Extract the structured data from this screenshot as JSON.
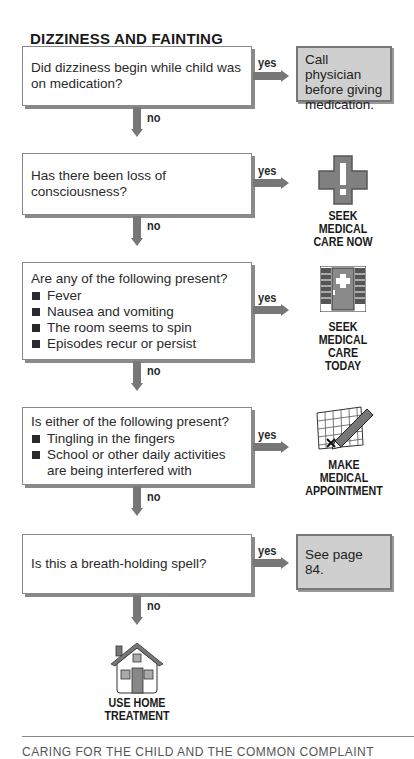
{
  "title": "DIZZINESS AND FAINTING",
  "colors": {
    "arrow": "#777777",
    "result_box_bg": "#cfcfcf",
    "icon_fill": "#808080"
  },
  "labels": {
    "yes": "yes",
    "no": "no"
  },
  "questions": [
    {
      "text": "Did dizziness begin while child was on medication?",
      "bullets": []
    },
    {
      "text": "Has there been loss of consciousness?",
      "bullets": []
    },
    {
      "text": "Are any of the following present?",
      "bullets": [
        "Fever",
        "Nausea and vomiting",
        "The room seems to spin",
        "Episodes recur or persist"
      ]
    },
    {
      "text": "Is either of the following present?",
      "bullets": [
        "Tingling in the fingers",
        "School or other daily activities are being interfered with"
      ]
    },
    {
      "text": "Is this a breath-holding spell?",
      "bullets": []
    }
  ],
  "outcomes": {
    "call_physician": "Call physician before giving medication.",
    "seek_now": [
      "SEEK",
      "MEDICAL",
      "CARE NOW"
    ],
    "seek_today": [
      "SEEK",
      "MEDICAL",
      "CARE TODAY"
    ],
    "appointment": [
      "MAKE",
      "MEDICAL",
      "APPOINTMENT"
    ],
    "see_page": "See page 84.",
    "home": [
      "USE HOME",
      "TREATMENT"
    ]
  },
  "footer": "CARING FOR THE CHILD AND THE COMMON COMPLAINT"
}
